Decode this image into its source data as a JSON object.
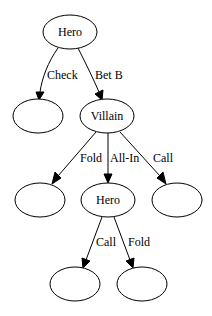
{
  "diagram": {
    "type": "game-tree",
    "nodes": [
      {
        "id": "n0",
        "label": "Hero",
        "cx": 70,
        "cy": 32,
        "rx": 27,
        "ry": 17
      },
      {
        "id": "n1",
        "label": "",
        "cx": 38,
        "cy": 116,
        "rx": 25,
        "ry": 17
      },
      {
        "id": "n2",
        "label": "Villain",
        "cx": 107,
        "cy": 116,
        "rx": 27,
        "ry": 17
      },
      {
        "id": "n3",
        "label": "",
        "cx": 40,
        "cy": 200,
        "rx": 25,
        "ry": 17
      },
      {
        "id": "n4",
        "label": "Hero",
        "cx": 108,
        "cy": 200,
        "rx": 27,
        "ry": 17
      },
      {
        "id": "n5",
        "label": "",
        "cx": 177,
        "cy": 200,
        "rx": 25,
        "ry": 17
      },
      {
        "id": "n6",
        "label": "",
        "cx": 75,
        "cy": 284,
        "rx": 25,
        "ry": 17
      },
      {
        "id": "n7",
        "label": "",
        "cx": 142,
        "cy": 284,
        "rx": 25,
        "ry": 17
      }
    ],
    "edges": [
      {
        "from": "n0",
        "to": "n1",
        "label": "Check"
      },
      {
        "from": "n0",
        "to": "n2",
        "label": "Bet B"
      },
      {
        "from": "n2",
        "to": "n3",
        "label": "Fold"
      },
      {
        "from": "n2",
        "to": "n4",
        "label": "All-In"
      },
      {
        "from": "n2",
        "to": "n5",
        "label": "Call"
      },
      {
        "from": "n4",
        "to": "n6",
        "label": "Call"
      },
      {
        "from": "n4",
        "to": "n7",
        "label": "Fold"
      }
    ]
  }
}
